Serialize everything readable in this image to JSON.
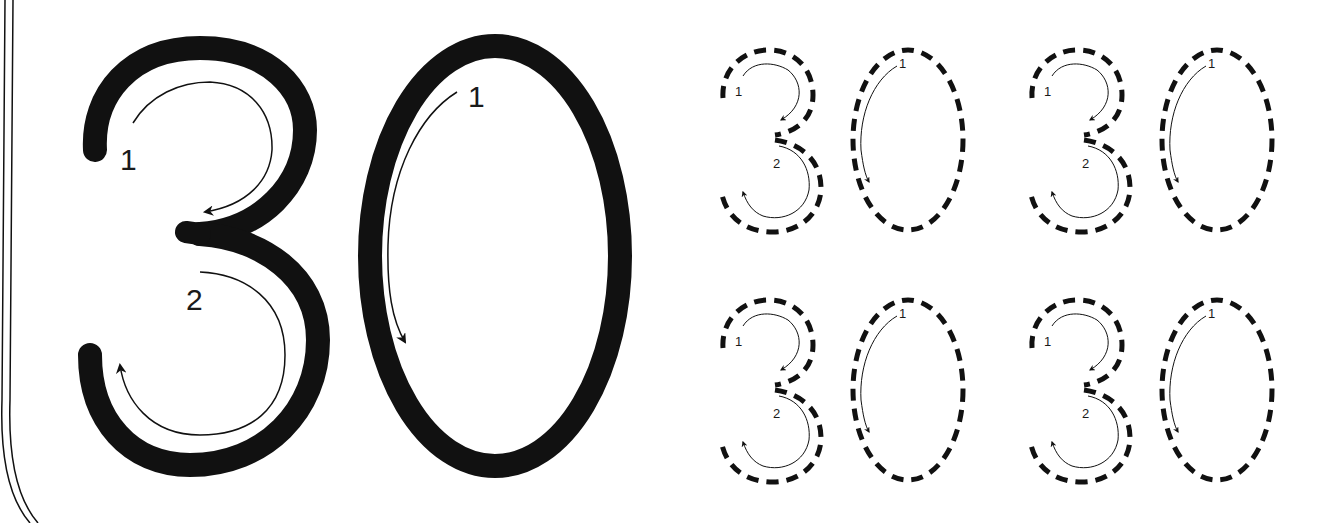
{
  "worksheet": {
    "number": "30",
    "digits": [
      "3",
      "0"
    ],
    "colors": {
      "ink": "#111111",
      "background": "#ffffff",
      "guide": "#222222"
    },
    "model": {
      "digit_3": {
        "stroke_labels": [
          "1",
          "2"
        ]
      },
      "digit_0": {
        "stroke_labels": [
          "1"
        ]
      }
    },
    "practice": [
      {
        "position": "top-left",
        "labels": {
          "three_a": "1",
          "three_b": "2",
          "zero": "1"
        }
      },
      {
        "position": "top-right",
        "labels": {
          "three_a": "1",
          "three_b": "2",
          "zero": "1"
        }
      },
      {
        "position": "bottom-left",
        "labels": {
          "three_a": "1",
          "three_b": "2",
          "zero": "1"
        }
      },
      {
        "position": "bottom-right",
        "labels": {
          "three_a": "1",
          "three_b": "2",
          "zero": "1"
        }
      }
    ]
  }
}
